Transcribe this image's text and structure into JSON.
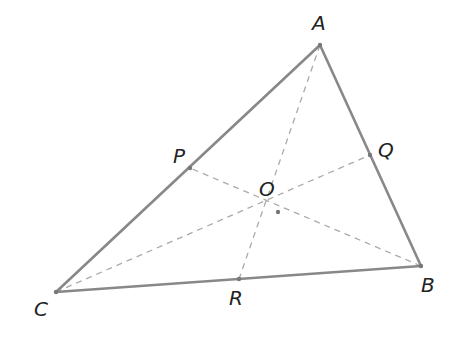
{
  "diagram": {
    "type": "triangle-cevians",
    "colors": {
      "side": "#888888",
      "cevian": "#aaaaaa",
      "label": "#222222",
      "point": "#777777"
    },
    "points": {
      "A": {
        "label": "A",
        "x": 320,
        "y": 45,
        "lx": 312,
        "ly": 30
      },
      "B": {
        "label": "B",
        "x": 421,
        "y": 266,
        "lx": 421,
        "ly": 292
      },
      "C": {
        "label": "C",
        "x": 56,
        "y": 292,
        "lx": 34,
        "ly": 316
      },
      "P": {
        "label": "P",
        "x": 190,
        "y": 168,
        "lx": 173,
        "ly": 163
      },
      "Q": {
        "label": "Q",
        "x": 370,
        "y": 155,
        "lx": 378,
        "ly": 157
      },
      "R": {
        "label": "R",
        "x": 239,
        "y": 279,
        "lx": 229,
        "ly": 305
      },
      "O": {
        "label": "O",
        "x": 278,
        "y": 212,
        "lx": 259,
        "ly": 196
      }
    }
  }
}
